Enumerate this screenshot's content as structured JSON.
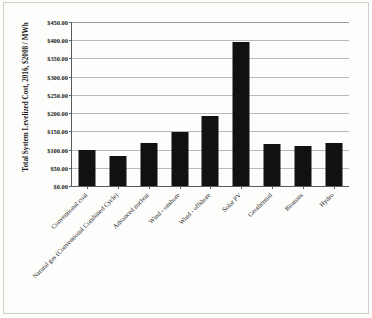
{
  "chart_data": {
    "type": "bar",
    "title": "",
    "xlabel": "",
    "ylabel": "Total System Levelized Cost, 2016, $2008 / MWh",
    "ylim": [
      0,
      450
    ],
    "ytick_values": [
      0,
      50,
      100,
      150,
      200,
      250,
      300,
      350,
      400,
      450
    ],
    "ytick_labels": [
      "$0.00",
      "$50.00",
      "$100.00",
      "$150.00",
      "$200.00",
      "$250.00",
      "$300.00",
      "$350.00",
      "$400.00",
      "$450.00"
    ],
    "grid": true,
    "legend": false,
    "bar_color": "#111111",
    "categories": [
      "Conventional coal",
      "Natural gas (Conventional Combined Cycle)",
      "Advanced nuclear",
      "Wind - onshore",
      "Wind - offshore",
      "Solar PV",
      "Geothermal",
      "Biomass",
      "Hydro"
    ],
    "values": [
      100,
      83,
      119,
      149,
      191,
      396,
      114,
      110,
      117
    ]
  }
}
